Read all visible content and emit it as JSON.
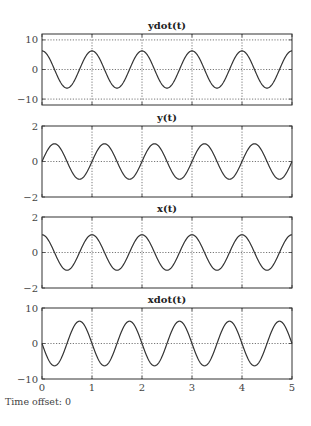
{
  "footer": {
    "label": "Time offset:",
    "value": "0"
  },
  "chart_data": [
    {
      "type": "line",
      "title": "ydot(t)",
      "xlabel": "",
      "ylabel": "",
      "xlim": [
        0,
        5
      ],
      "ylim": [
        -12,
        12
      ],
      "xticks": [
        0,
        1,
        2,
        3,
        4,
        5
      ],
      "yticks": [
        -10,
        0,
        10
      ],
      "ytick_labels": [
        "−10",
        "0",
        "10"
      ],
      "grid": true,
      "series": [
        {
          "name": "ydot",
          "function": "amplitude*cos(2*pi*t)",
          "amplitude": 6.28,
          "phase": "cos",
          "sign": 1,
          "t_range": [
            0,
            5
          ],
          "color": "#333333"
        }
      ]
    },
    {
      "type": "line",
      "title": "y(t)",
      "xlabel": "",
      "ylabel": "",
      "xlim": [
        0,
        5
      ],
      "ylim": [
        -2,
        2
      ],
      "xticks": [
        0,
        1,
        2,
        3,
        4,
        5
      ],
      "yticks": [
        -2,
        0,
        2
      ],
      "ytick_labels": [
        "−2",
        "0",
        "2"
      ],
      "grid": true,
      "series": [
        {
          "name": "y",
          "function": "amplitude*sin(2*pi*t)",
          "amplitude": 1,
          "phase": "sin",
          "sign": 1,
          "t_range": [
            0,
            5
          ],
          "color": "#333333"
        }
      ]
    },
    {
      "type": "line",
      "title": "x(t)",
      "xlabel": "",
      "ylabel": "",
      "xlim": [
        0,
        5
      ],
      "ylim": [
        -2,
        2
      ],
      "xticks": [
        0,
        1,
        2,
        3,
        4,
        5
      ],
      "yticks": [
        -2,
        0,
        2
      ],
      "ytick_labels": [
        "−2",
        "0",
        "2"
      ],
      "grid": true,
      "series": [
        {
          "name": "x",
          "function": "amplitude*cos(2*pi*t)",
          "amplitude": 1,
          "phase": "cos",
          "sign": 1,
          "t_range": [
            0,
            5
          ],
          "color": "#333333"
        }
      ]
    },
    {
      "type": "line",
      "title": "xdot(t)",
      "xlabel": "",
      "ylabel": "",
      "xlim": [
        0,
        5
      ],
      "ylim": [
        -10,
        10
      ],
      "xticks": [
        0,
        1,
        2,
        3,
        4,
        5
      ],
      "xtick_labels": [
        "0",
        "1",
        "2",
        "3",
        "4",
        "5"
      ],
      "yticks": [
        -10,
        0,
        10
      ],
      "ytick_labels": [
        "−10",
        "0",
        "10"
      ],
      "grid": true,
      "series": [
        {
          "name": "xdot",
          "function": "-amplitude*sin(2*pi*t)",
          "amplitude": 6.28,
          "phase": "sin",
          "sign": -1,
          "t_range": [
            0,
            5
          ],
          "color": "#333333"
        }
      ]
    }
  ]
}
